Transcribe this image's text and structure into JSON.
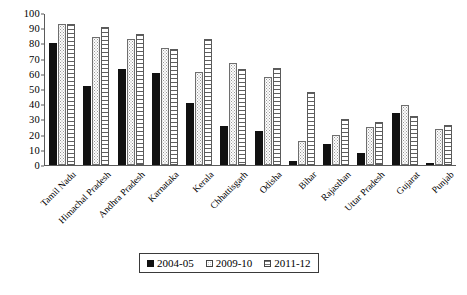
{
  "chart_data": {
    "type": "bar",
    "title": "",
    "xlabel": "",
    "ylabel": "",
    "ylim": [
      0,
      100
    ],
    "yticks": [
      0,
      10,
      20,
      30,
      40,
      50,
      60,
      70,
      80,
      90,
      100
    ],
    "grid": false,
    "legend_position": "bottom",
    "categories": [
      "Tamil Nadu",
      "Himachal Pradesh",
      "Andhra Pradesh",
      "Karnataka",
      "Kerala",
      "Chhattisgarh",
      "Odisha",
      "Bihar",
      "Rajasthan",
      "Uttar Pradesh",
      "Gujarat",
      "Punjab"
    ],
    "series": [
      {
        "name": "2004-05",
        "pattern": "solid-black",
        "values": [
          80,
          52,
          63,
          60.5,
          40.5,
          25.5,
          22.5,
          2.5,
          14,
          8,
          34,
          1
        ]
      },
      {
        "name": "2009-10",
        "pattern": "dotted",
        "values": [
          93,
          84,
          83,
          77,
          61,
          67,
          58,
          16,
          19.5,
          25,
          39.5,
          23.5
        ]
      },
      {
        "name": "2011-12",
        "pattern": "horizontal-stripes",
        "values": [
          93,
          91,
          86,
          76.5,
          83,
          63,
          64,
          48,
          30,
          28,
          32.5,
          26
        ]
      }
    ]
  },
  "legend": {
    "items": [
      {
        "label": "2004-05"
      },
      {
        "label": "2009-10"
      },
      {
        "label": "2011-12"
      }
    ]
  }
}
